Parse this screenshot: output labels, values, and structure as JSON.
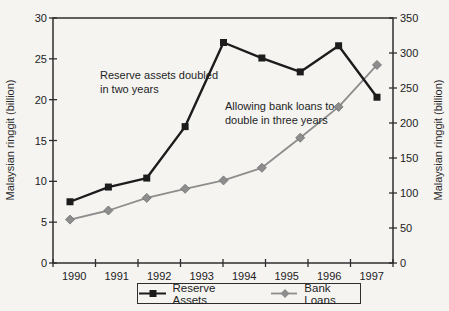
{
  "chart_data": {
    "type": "line",
    "title_fragment": "1990–97",
    "x_axis": {
      "tick_labels": [
        "1990",
        "1991",
        "1992",
        "1993",
        "1994",
        "1995",
        "1996",
        "1997"
      ]
    },
    "left_axis": {
      "label": "Malaysian ringgit (billion)",
      "min": 0,
      "max": 30,
      "ticks": [
        0,
        5,
        10,
        15,
        20,
        25,
        30
      ]
    },
    "right_axis": {
      "label": "Malaysian ringgit (billion)",
      "min": 0,
      "max": 350,
      "ticks": [
        0,
        50,
        100,
        150,
        200,
        250,
        300,
        350
      ]
    },
    "series": [
      {
        "name": "Reserve Assets",
        "axis": "left",
        "marker": "square",
        "color": "#1c1c1c",
        "x": [
          1990,
          1990.875,
          1991.75,
          1992.625,
          1993.5,
          1994.375,
          1995.25,
          1996.125,
          1997
        ],
        "values": [
          7.5,
          9.3,
          10.4,
          16.7,
          27.0,
          25.1,
          23.4,
          26.6,
          20.3
        ]
      },
      {
        "name": "Bank Loans",
        "axis": "right",
        "marker": "diamond",
        "color": "#8d8d8d",
        "x": [
          1990,
          1990.875,
          1991.75,
          1992.625,
          1993.5,
          1994.375,
          1995.25,
          1996.125,
          1997
        ],
        "values": [
          62,
          75,
          93,
          106,
          118,
          136,
          179,
          223,
          283
        ]
      }
    ],
    "annotations": [
      {
        "lines": [
          "Reserve assets doubled",
          "in two years"
        ]
      },
      {
        "lines": [
          "Allowing bank loans to",
          "double in three years"
        ]
      }
    ],
    "legend": {
      "position": "bottom",
      "items": [
        "Reserve Assets",
        "Bank Loans"
      ]
    },
    "grid": false
  },
  "colors": {
    "background": "#f5f4f1",
    "ink": "#222222",
    "axis": "#2e2e2e",
    "reserve": "#1c1c1c",
    "bank": "#8d8d8d",
    "bank_outline": "#6f6f6f"
  }
}
